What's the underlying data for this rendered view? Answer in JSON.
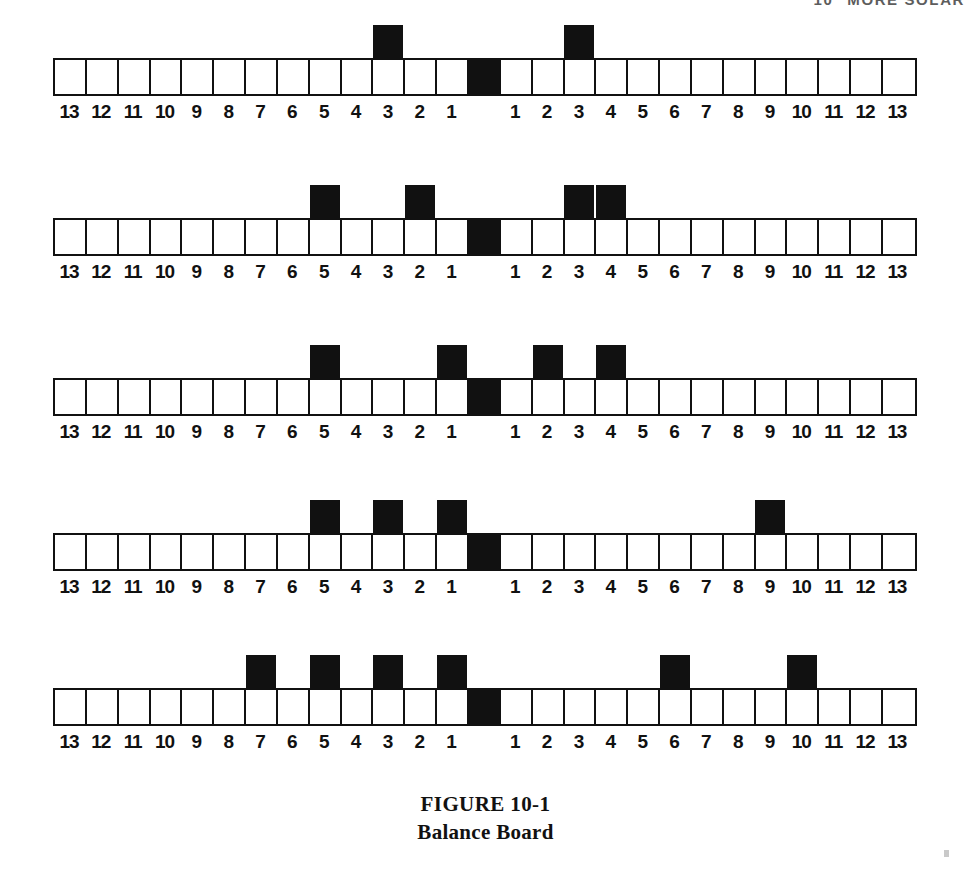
{
  "running_head": {
    "page_number": "10",
    "title": "MORE SOLAR"
  },
  "figure": {
    "caption_line1": "FIGURE 10-1",
    "caption_line2": "Balance Board"
  },
  "board": {
    "arm_length": 13,
    "left_labels": [
      "13",
      "12",
      "11",
      "10",
      "9",
      "8",
      "7",
      "6",
      "5",
      "4",
      "3",
      "2",
      "1"
    ],
    "right_labels": [
      "1",
      "2",
      "3",
      "4",
      "5",
      "6",
      "7",
      "8",
      "9",
      "10",
      "11",
      "12",
      "13"
    ],
    "fulcrum_label": ""
  },
  "chart_data": {
    "type": "diagram",
    "title": "FIGURE 10-1",
    "subtitle": "Balance Board",
    "xlabel": "Distance from fulcrum (left) ... Distance from fulcrum (right)",
    "ylabel": "",
    "categories": [
      "13",
      "12",
      "11",
      "10",
      "9",
      "8",
      "7",
      "6",
      "5",
      "4",
      "3",
      "2",
      "1",
      "F",
      "1",
      "2",
      "3",
      "4",
      "5",
      "6",
      "7",
      "8",
      "9",
      "10",
      "11",
      "12",
      "13"
    ],
    "rows": [
      {
        "index": 1,
        "left_weights": [
          3
        ],
        "right_weights": [
          3
        ],
        "left_moment": 3,
        "right_moment": 3,
        "balanced": true
      },
      {
        "index": 2,
        "left_weights": [
          5,
          2
        ],
        "right_weights": [
          3,
          4
        ],
        "left_moment": 7,
        "right_moment": 7,
        "balanced": true
      },
      {
        "index": 3,
        "left_weights": [
          5,
          1
        ],
        "right_weights": [
          2,
          4
        ],
        "left_moment": 6,
        "right_moment": 6,
        "balanced": true
      },
      {
        "index": 4,
        "left_weights": [
          5,
          3,
          1
        ],
        "right_weights": [
          9
        ],
        "left_moment": 9,
        "right_moment": 9,
        "balanced": true
      },
      {
        "index": 5,
        "left_weights": [
          7,
          5,
          3,
          1
        ],
        "right_weights": [
          6,
          10
        ],
        "left_moment": 16,
        "right_moment": 16,
        "balanced": true
      }
    ]
  },
  "colors": {
    "ink": "#111111",
    "paper": "#ffffff"
  }
}
